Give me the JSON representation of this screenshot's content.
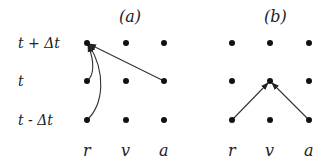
{
  "panels": [
    {
      "id": "a",
      "label": "(a)"
    },
    {
      "id": "b",
      "label": "(b)"
    }
  ],
  "row_labels": [
    "t + Δt",
    "t",
    "t - Δt"
  ],
  "column_labels": [
    "r",
    "v",
    "a"
  ],
  "grid": {
    "rows": 3,
    "columns": 3,
    "dot_color": "#111111"
  },
  "arrows": {
    "panel_a": [
      {
        "from": "a@t",
        "to": "r@t+Δt",
        "shape": "straight"
      },
      {
        "from": "r@t",
        "to": "r@t+Δt",
        "shape": "curved"
      },
      {
        "from": "r@t-Δt",
        "to": "r@t+Δt",
        "shape": "curved"
      }
    ],
    "panel_b": [
      {
        "from": "r@t-Δt",
        "to": "v@t",
        "shape": "straight"
      },
      {
        "from": "a@t-Δt",
        "to": "v@t",
        "shape": "straight"
      }
    ]
  },
  "colors": {
    "line": "#333333",
    "text": "#222222"
  }
}
